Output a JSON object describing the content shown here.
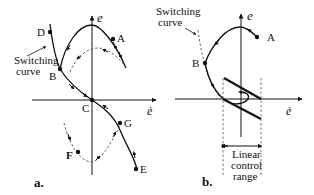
{
  "panel_a": {
    "caption": "a.",
    "axis_y_label": "e",
    "axis_x_label": "ė",
    "switching_label_line1": "Switching",
    "switching_label_line2": "curve",
    "points": {
      "A": "A",
      "B": "B",
      "C": "C",
      "D": "D",
      "E": "E",
      "F": "F",
      "G": "G"
    }
  },
  "panel_b": {
    "caption": "b.",
    "axis_y_label": "e",
    "axis_x_label": "ė",
    "switching_label_line1": "Switching",
    "switching_label_line2": "curve",
    "points": {
      "A": "A",
      "B": "B"
    },
    "range_label_line1": "Linear",
    "range_label_line2": "control",
    "range_label_line3": "range"
  },
  "colors": {
    "ink": "#111111",
    "dashed": "#555555",
    "background": "#ffffff"
  }
}
